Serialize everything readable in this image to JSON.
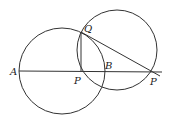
{
  "diagram": {
    "labels": {
      "A": "A",
      "P": "P",
      "B": "B",
      "Q": "Q",
      "P_prime": "P"
    },
    "stroke_color": "#333333"
  }
}
